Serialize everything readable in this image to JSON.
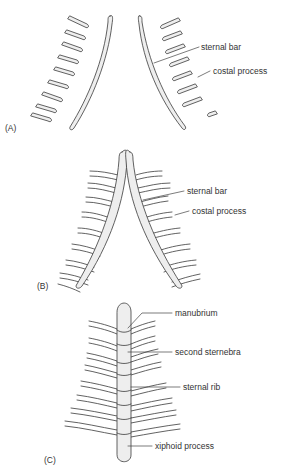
{
  "figure": {
    "panels": [
      {
        "id": "A",
        "label": "(A)",
        "annotations": [
          {
            "text": "sternal bar"
          },
          {
            "text": "costal process"
          }
        ]
      },
      {
        "id": "B",
        "label": "(B)",
        "annotations": [
          {
            "text": "sternal bar"
          },
          {
            "text": "costal process"
          }
        ]
      },
      {
        "id": "C",
        "label": "(C)",
        "annotations": [
          {
            "text": "manubrium"
          },
          {
            "text": "second sternebra"
          },
          {
            "text": "sternal rib"
          },
          {
            "text": "xiphoid process"
          }
        ]
      }
    ]
  },
  "colors": {
    "stroke": "#3a3a3a",
    "fill": "#eeeeee",
    "text": "#333333",
    "background": "#ffffff"
  }
}
